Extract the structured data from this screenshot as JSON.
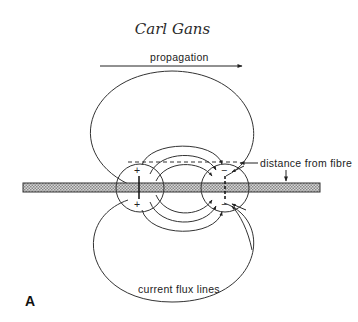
{
  "header": {
    "author": "Carl Gans"
  },
  "figure": {
    "panel_label": "A",
    "labels": {
      "propagation": "propagation",
      "distance": "distance from fibre",
      "flux": "current flux lines"
    },
    "signs": {
      "plus": "+",
      "minus": "−"
    }
  }
}
